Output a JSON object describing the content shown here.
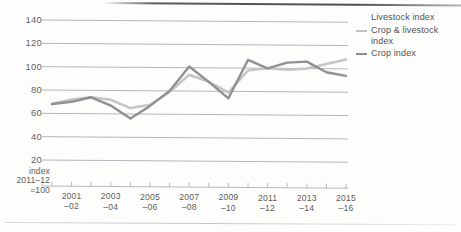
{
  "figure": {
    "background_color": "#fdfdfc",
    "rule_color": "#4e4e52"
  },
  "legend": {
    "position": "right",
    "entries": [
      {
        "label": "Livestock index",
        "color": "#c9c9cb",
        "has_marker": false
      },
      {
        "label": "Crop & livestock index",
        "color": "#c3c3c5",
        "has_marker": true
      },
      {
        "label": "Crop index",
        "color": "#8e8e93",
        "has_marker": true
      }
    ]
  },
  "axes": {
    "y_ticks": [
      "140",
      "120",
      "100",
      "80",
      "60",
      "40",
      "20"
    ],
    "y_note_lines": [
      "index",
      "2011–12",
      "=100"
    ],
    "x_ticks": [
      {
        "y1": "2001",
        "y2": "–02"
      },
      {
        "y1": "2003",
        "y2": "–04"
      },
      {
        "y1": "2005",
        "y2": "–06"
      },
      {
        "y1": "2007",
        "y2": "–08"
      },
      {
        "y1": "2009",
        "y2": "–10"
      },
      {
        "y1": "2011",
        "y2": "–12"
      },
      {
        "y1": "2013",
        "y2": "–14"
      },
      {
        "y1": "2015",
        "y2": "–16"
      }
    ]
  },
  "chart_data": {
    "type": "line",
    "title": "",
    "xlabel": "",
    "ylabel": "index 2011–12 =100",
    "ylim": [
      0,
      145
    ],
    "yticks": [
      20,
      40,
      60,
      80,
      100,
      120,
      140
    ],
    "grid": true,
    "legend_position": "right",
    "x": [
      "2000–01",
      "2001–02",
      "2002–03",
      "2003–04",
      "2004–05",
      "2005–06",
      "2006–07",
      "2007–08",
      "2008–09",
      "2009–10",
      "2010–11",
      "2011–12",
      "2012–13",
      "2013–14",
      "2014–15",
      "2015–16"
    ],
    "series": [
      {
        "name": "Crop & livestock index",
        "color": "#c3c3c5",
        "values": [
          68,
          72,
          74,
          72,
          65,
          68,
          79,
          94,
          88,
          79,
          98,
          100,
          99,
          100,
          104,
          108
        ]
      },
      {
        "name": "Crop index",
        "color": "#8e8e93",
        "values": [
          68,
          70,
          74,
          67,
          56,
          67,
          80,
          101,
          88,
          74,
          107,
          100,
          105,
          106,
          97,
          94
        ]
      }
    ]
  }
}
